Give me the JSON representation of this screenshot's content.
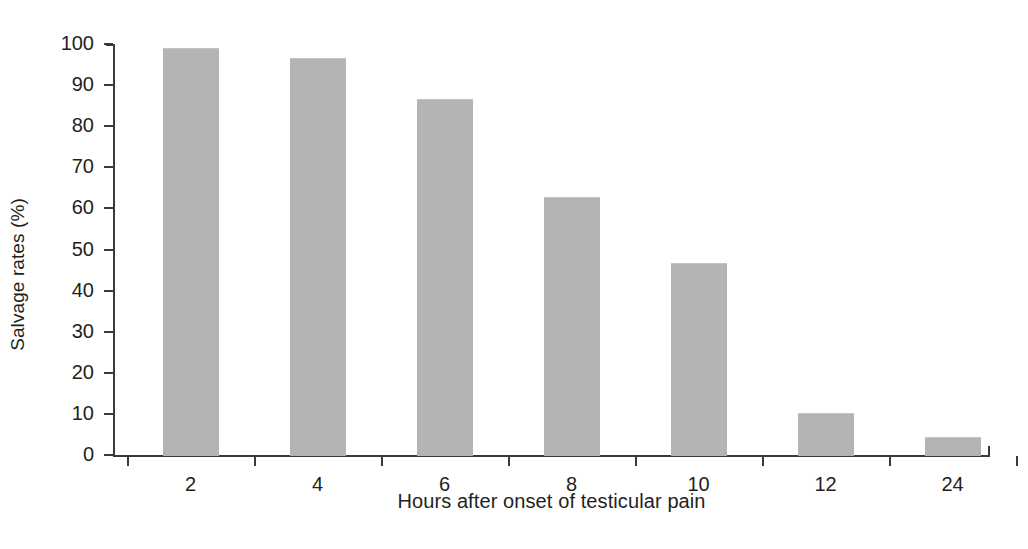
{
  "chart_data": {
    "type": "bar",
    "title": "",
    "xlabel": "Hours after onset of testicular pain",
    "ylabel": "Salvage rates (%)",
    "categories": [
      "2",
      "4",
      "6",
      "8",
      "10",
      "12",
      "24"
    ],
    "values": [
      99,
      96.5,
      86.5,
      62.8,
      46.6,
      10.3,
      4.5
    ],
    "series": [
      {
        "name": "Salvage rate",
        "values": [
          99,
          96.5,
          86.5,
          62.8,
          46.6,
          10.3,
          4.5
        ]
      }
    ],
    "ylim": [
      0,
      100
    ],
    "ytick_values": [
      0,
      10,
      20,
      30,
      40,
      50,
      60,
      70,
      80,
      90,
      100
    ],
    "ytick_labels": [
      "0",
      "10",
      "20",
      "30",
      "40",
      "50",
      "60",
      "70",
      "80",
      "90",
      "100"
    ],
    "grid": false,
    "legend": false,
    "legend_position": "none",
    "bar_color": "#b4b4b4",
    "axis_color": "#3a3a3c",
    "text_color": "#231f20",
    "background": "#ffffff"
  }
}
